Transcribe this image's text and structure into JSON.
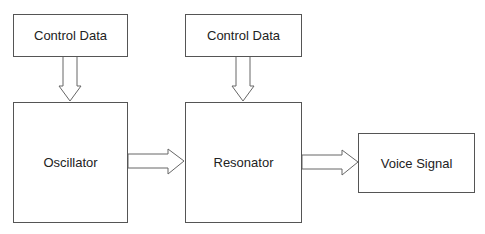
{
  "diagram": {
    "nodes": {
      "control_data_1": {
        "label": "Control Data"
      },
      "control_data_2": {
        "label": "Control Data"
      },
      "oscillator": {
        "label": "Oscillator"
      },
      "resonator": {
        "label": "Resonator"
      },
      "voice_signal": {
        "label": "Voice Signal"
      }
    },
    "edges": [
      {
        "from": "control_data_1",
        "to": "oscillator"
      },
      {
        "from": "control_data_2",
        "to": "resonator"
      },
      {
        "from": "oscillator",
        "to": "resonator"
      },
      {
        "from": "resonator",
        "to": "voice_signal"
      }
    ],
    "colors": {
      "stroke": "#555555",
      "text": "#222222",
      "background": "#ffffff"
    }
  }
}
